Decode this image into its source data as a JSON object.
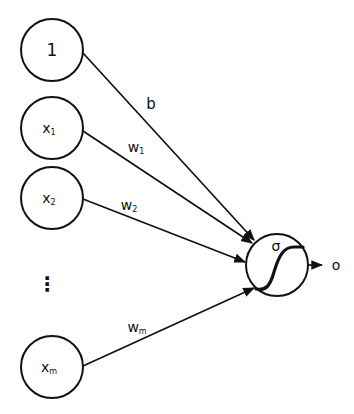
{
  "diagram": {
    "type": "perceptron",
    "stroke_color": "#111111",
    "inputs": [
      {
        "id": "bias",
        "label": "1",
        "sub": "",
        "cx": 52,
        "cy": 50
      },
      {
        "id": "x1",
        "label": "x",
        "sub": "1",
        "cx": 52,
        "cy": 128
      },
      {
        "id": "x2",
        "label": "x",
        "sub": "2",
        "cx": 52,
        "cy": 198
      },
      {
        "id": "xm",
        "label": "x",
        "sub": "m",
        "cx": 52,
        "cy": 367
      }
    ],
    "ellipsis": "⋮",
    "weights": [
      {
        "id": "b",
        "label": "b",
        "sub": ""
      },
      {
        "id": "w1",
        "label": "w",
        "sub": "1"
      },
      {
        "id": "w2",
        "label": "w",
        "sub": "2"
      },
      {
        "id": "wm",
        "label": "w",
        "sub": "m"
      }
    ],
    "neuron": {
      "activation_label": "σ",
      "cx": 277,
      "cy": 265,
      "r": 31
    },
    "output": {
      "label": "o"
    }
  }
}
